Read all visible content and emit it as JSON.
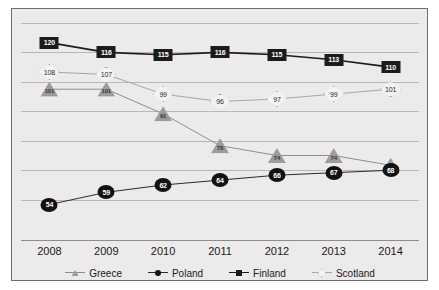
{
  "chart_data": {
    "type": "line",
    "title": "",
    "xlabel": "",
    "ylabel": "",
    "categories": [
      "2008",
      "2009",
      "2010",
      "2011",
      "2012",
      "2013",
      "2014"
    ],
    "ylim": [
      40,
      130
    ],
    "grid": true,
    "gridlines_y": [
      128,
      116,
      104,
      92,
      80,
      68,
      56
    ],
    "legend_position": "bottom",
    "series": [
      {
        "name": "Greece",
        "marker": "triangle",
        "color": "#9d9b9b",
        "line_color": "#8f8d8d",
        "values": [
          101,
          101,
          91,
          78,
          74,
          74,
          70
        ]
      },
      {
        "name": "Poland",
        "marker": "circle",
        "color": "#121212",
        "line_color": "#2a2a2a",
        "values": [
          54,
          59,
          62,
          64,
          66,
          67,
          68
        ]
      },
      {
        "name": "Finland",
        "marker": "square",
        "color": "#1b1b1b",
        "line_color": "#1b1b1b",
        "values": [
          120,
          116,
          115,
          116,
          115,
          113,
          110
        ]
      },
      {
        "name": "Scotland",
        "marker": "diamond",
        "color": "#f4f3f3",
        "line_color": "#a8a6a6",
        "values": [
          108,
          107,
          99,
          96,
          97,
          99,
          101
        ]
      }
    ]
  },
  "legend": {
    "items": [
      {
        "label": "Greece"
      },
      {
        "label": "Poland"
      },
      {
        "label": "Finland"
      },
      {
        "label": "Scotland"
      }
    ]
  }
}
